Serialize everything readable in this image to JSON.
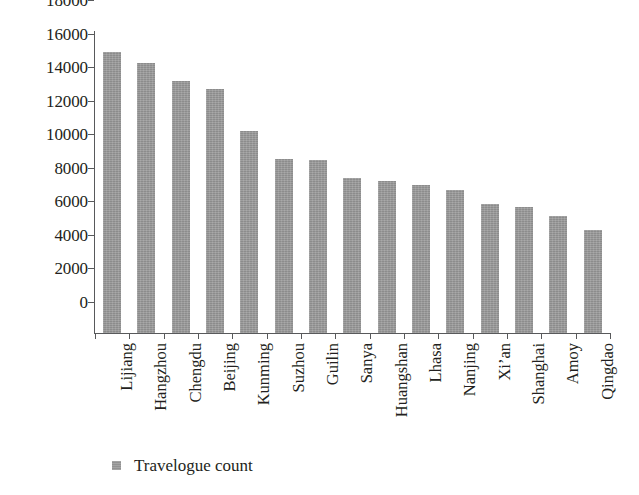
{
  "chart_data": {
    "type": "bar",
    "title": "",
    "xlabel": "",
    "ylabel": "",
    "ylim": [
      0,
      18000
    ],
    "yticks": [
      0,
      2000,
      4000,
      6000,
      8000,
      10000,
      12000,
      14000,
      16000,
      18000
    ],
    "ytick_labels": [
      "0",
      "2000",
      "4000",
      "6000",
      "8000",
      "10000",
      "12000",
      "14000",
      "16000",
      "18000"
    ],
    "grid": false,
    "legend_position": "bottom-left",
    "categories": [
      "Lijiang",
      "Hangzhou",
      "Chengdu",
      "Beijing",
      "Kunming",
      "Suzhou",
      "Guilin",
      "Sanya",
      "Huangshan",
      "Lhasa",
      "Nanjing",
      "Xi’an",
      "Shanghai",
      "Amoy",
      "Qingdao"
    ],
    "series": [
      {
        "name": "Travelogue count",
        "color": "#9a9a9a",
        "values": [
          16750,
          16100,
          15000,
          14550,
          12050,
          10350,
          10300,
          9250,
          9050,
          8800,
          8500,
          7700,
          7500,
          7000,
          6150
        ]
      }
    ]
  },
  "legend": {
    "marker_name": "square-marker",
    "label": "Travelogue count"
  }
}
